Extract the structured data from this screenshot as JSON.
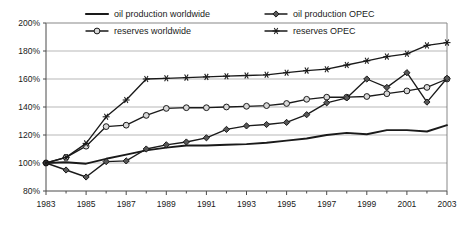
{
  "chart_data": {
    "type": "line",
    "title": "",
    "xlabel": "",
    "ylabel": "",
    "xlim": [
      1983,
      2003
    ],
    "ylim": [
      80,
      200
    ],
    "ytick_step": 20,
    "xtick_step": 2,
    "grid": true,
    "legend_position": "top-inside",
    "x": [
      1983,
      1984,
      1985,
      1986,
      1987,
      1988,
      1989,
      1990,
      1991,
      1992,
      1993,
      1994,
      1995,
      1996,
      1997,
      1998,
      1999,
      2000,
      2001,
      2002,
      2003
    ],
    "ytick_labels": [
      "80%",
      "100%",
      "120%",
      "140%",
      "160%",
      "180%",
      "200%"
    ],
    "xtick_labels": [
      "1983",
      "1985",
      "1987",
      "1989",
      "1991",
      "1993",
      "1995",
      "1997",
      "1999",
      "2001",
      "2003"
    ],
    "series": [
      {
        "name": "oil production worldwide",
        "marker": "none",
        "values": [
          100,
          100.5,
          99.5,
          103,
          106,
          109,
          111,
          112.5,
          112.5,
          113,
          113.5,
          114.5,
          116,
          117.5,
          120,
          121.5,
          120.5,
          123.5,
          123.5,
          122.5,
          127
        ]
      },
      {
        "name": "reserves worldwide",
        "marker": "open-circle",
        "values": [
          100,
          104,
          112,
          126,
          127,
          134,
          139,
          139.5,
          139.5,
          140,
          140.5,
          141,
          142.5,
          145.5,
          147,
          147,
          147.5,
          149.5,
          151.5,
          154,
          160
        ]
      },
      {
        "name": "oil production OPEC",
        "marker": "filled-diamond",
        "values": [
          100,
          95,
          90,
          101,
          101.5,
          110,
          113,
          115,
          118,
          124,
          126.5,
          127.5,
          129,
          134.5,
          143,
          146.5,
          160,
          154,
          164.5,
          143.5,
          160.5
        ]
      },
      {
        "name": "reserves OPEC",
        "marker": "asterisk",
        "values": [
          100,
          104,
          114,
          133,
          145,
          160,
          160.5,
          161,
          161.5,
          162,
          162.5,
          163,
          164.5,
          166,
          167,
          170,
          173,
          176,
          178,
          184,
          186
        ]
      }
    ]
  },
  "legend": {
    "items": [
      {
        "label": "oil production worldwide",
        "marker": "none"
      },
      {
        "label": "oil production OPEC",
        "marker": "filled-diamond"
      },
      {
        "label": "reserves worldwide",
        "marker": "open-circle"
      },
      {
        "label": "reserves OPEC",
        "marker": "asterisk"
      }
    ]
  }
}
